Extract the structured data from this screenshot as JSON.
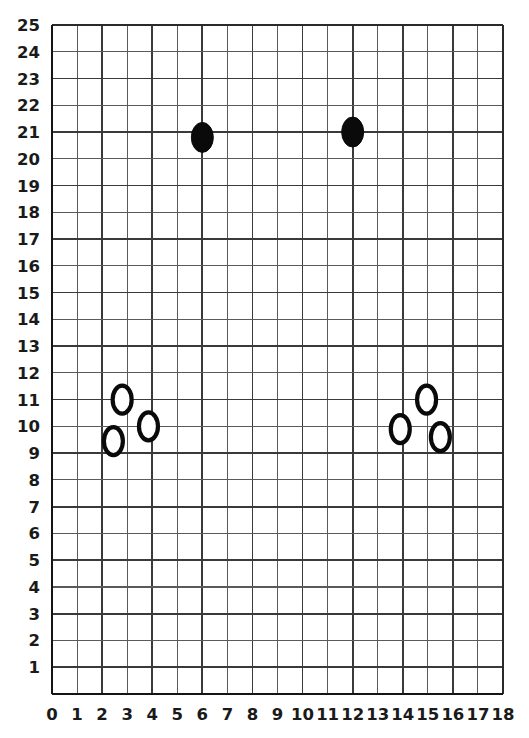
{
  "chart_data": {
    "type": "scatter",
    "title": "",
    "subtitle": "",
    "xlabel": "",
    "ylabel": "",
    "xlim": [
      0,
      18
    ],
    "ylim": [
      0,
      25
    ],
    "xticks": [
      0,
      1,
      2,
      3,
      4,
      5,
      6,
      7,
      8,
      9,
      10,
      11,
      12,
      13,
      14,
      15,
      16,
      17,
      18
    ],
    "yticks": [
      0,
      1,
      2,
      3,
      4,
      5,
      6,
      7,
      8,
      9,
      10,
      11,
      12,
      13,
      14,
      15,
      16,
      17,
      18,
      19,
      20,
      21,
      22,
      23,
      24,
      25
    ],
    "xtick_labels": [
      "0",
      "1",
      "2",
      "3",
      "4",
      "5",
      "6",
      "7",
      "8",
      "9",
      "10",
      "11",
      "12",
      "13",
      "14",
      "15",
      "16",
      "17",
      "18"
    ],
    "ytick_labels": [
      "1",
      "2",
      "3",
      "4",
      "5",
      "6",
      "7",
      "8",
      "9",
      "10",
      "11",
      "12",
      "13",
      "14",
      "15",
      "16",
      "17",
      "18",
      "19",
      "20",
      "21",
      "22",
      "23",
      "24",
      "25"
    ],
    "grid": true,
    "grid_step_x": 1,
    "grid_step_y": 1,
    "legend": null,
    "legend_position": "none",
    "marker_shape": "ellipse",
    "marker_rx": 11,
    "marker_ry": 15,
    "colors": {
      "filled_marker": "#0a0a0a",
      "hollow_marker_stroke": "#0a0a0a",
      "hollow_marker_fill": "#ffffff",
      "grid_minor": "#5a5a5a",
      "grid_major": "#3a3a3a",
      "axis": "#151515",
      "label_text": "#1a1a1a",
      "background": "#ffffff"
    },
    "series": [
      {
        "name": "filled",
        "style": "filled",
        "points": [
          {
            "x": 6.0,
            "y": 20.8
          },
          {
            "x": 12.0,
            "y": 21.0
          }
        ]
      },
      {
        "name": "hollow",
        "style": "hollow",
        "points": [
          {
            "x": 2.45,
            "y": 9.45
          },
          {
            "x": 2.8,
            "y": 11.0
          },
          {
            "x": 3.85,
            "y": 10.0
          },
          {
            "x": 13.9,
            "y": 9.9
          },
          {
            "x": 14.95,
            "y": 11.0
          },
          {
            "x": 15.5,
            "y": 9.6
          }
        ]
      }
    ]
  }
}
